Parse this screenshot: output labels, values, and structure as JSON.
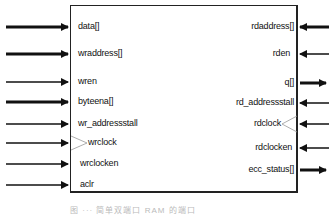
{
  "diagram": {
    "type": "block-port-diagram",
    "left_ports": [
      {
        "label": "data[]",
        "direction": "in",
        "bus": true
      },
      {
        "label": "wraddress[]",
        "direction": "in",
        "bus": true
      },
      {
        "label": "wren",
        "direction": "in",
        "bus": false
      },
      {
        "label": "byteena[]",
        "direction": "in",
        "bus": true
      },
      {
        "label": "wr_addressstall",
        "direction": "in",
        "bus": false
      },
      {
        "label": "wrclock",
        "direction": "in",
        "bus": false,
        "clock": true
      },
      {
        "label": "wrclocken",
        "direction": "in",
        "bus": false
      },
      {
        "label": "aclr",
        "direction": "in",
        "bus": false
      }
    ],
    "right_ports": [
      {
        "label": "rdaddress[]",
        "direction": "in",
        "bus": true
      },
      {
        "label": "rden",
        "direction": "in",
        "bus": false
      },
      {
        "label": "q[]",
        "direction": "out",
        "bus": true
      },
      {
        "label": "rd_addressstall",
        "direction": "in",
        "bus": false
      },
      {
        "label": "rdclock",
        "direction": "in",
        "bus": false,
        "clock": true
      },
      {
        "label": "rdclocken",
        "direction": "in",
        "bus": false
      },
      {
        "label": "ecc_status[]",
        "direction": "out",
        "bus": true
      }
    ],
    "caption": "图 ··· 简单双端口 RAM 的端口"
  }
}
